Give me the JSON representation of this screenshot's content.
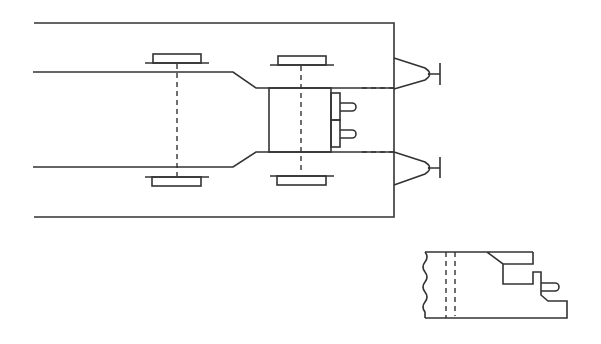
{
  "diagram": {
    "type": "technical line drawing",
    "views": [
      {
        "name": "plan-view",
        "description": "Top view of a vehicle frame with two axles, transverse component block and two towing hitches"
      },
      {
        "name": "side-detail-view",
        "description": "Broken side section detail of frame end with stepped profile and pin"
      }
    ],
    "colors": {
      "stroke": "#333333",
      "background": "#ffffff"
    }
  }
}
